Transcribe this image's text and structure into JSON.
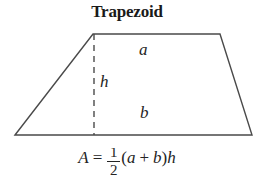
{
  "figure": {
    "title": "Trapezoid",
    "background_color": "#ffffff",
    "line_color": "#4a4a4a",
    "text_color": "#242424"
  },
  "shape": {
    "name": "trapezoid",
    "vertices": {
      "bottom_left": [
        15,
        135
      ],
      "top_left": [
        93,
        34
      ],
      "top_right": [
        220,
        34
      ],
      "bottom_right": [
        252,
        135
      ]
    },
    "height_line": {
      "style": "dashed",
      "from": [
        94,
        34
      ],
      "to": [
        94,
        135
      ]
    }
  },
  "labels": {
    "top_side": "a",
    "bottom_side": "b",
    "height": "h"
  },
  "formula": {
    "area_symbol": "A",
    "equals": "=",
    "fraction_numerator": "1",
    "fraction_denominator": "2",
    "open_paren": "(",
    "term_a": "a",
    "plus": "+",
    "term_b": "b",
    "close_paren": ")",
    "term_h": "h"
  }
}
